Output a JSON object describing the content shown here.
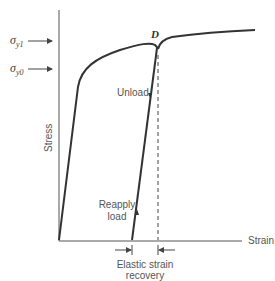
{
  "diagram": {
    "title": "",
    "axes": {
      "x_label": "Strain",
      "y_label": "Stress"
    },
    "markers": {
      "sigma_y1": {
        "symbol": "σ",
        "subscript": "y1"
      },
      "sigma_y0": {
        "symbol": "σ",
        "subscript": "y0"
      }
    },
    "point_label": "D",
    "annotations": {
      "unload": "Unload",
      "reapply_line1": "Reapply",
      "reapply_line2": "load",
      "elastic_line1": "Elastic strain",
      "elastic_line2": "recovery"
    },
    "colors": {
      "curve": "#333333",
      "axis": "#555555",
      "text": "#555555"
    }
  }
}
